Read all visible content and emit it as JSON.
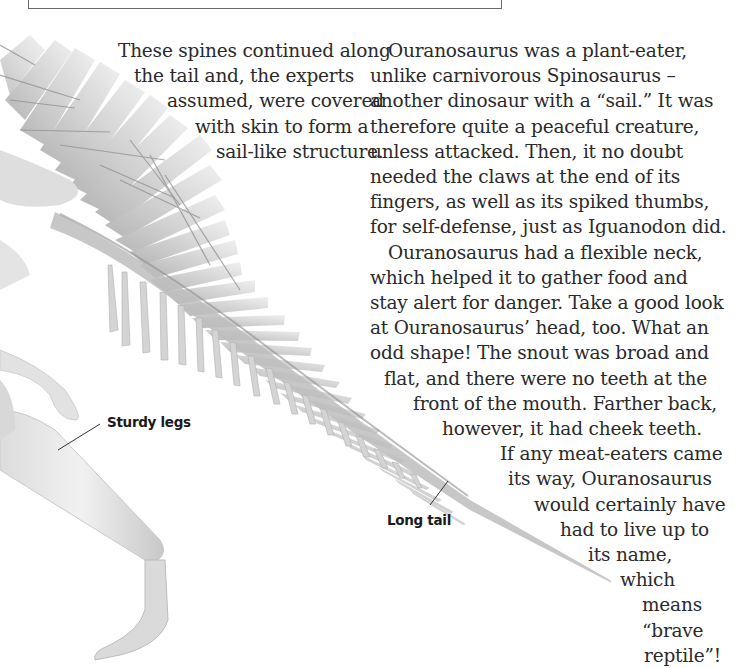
{
  "page": {
    "caption_left": {
      "lines": [
        "These spines continued along",
        "the tail and, the experts",
        "assumed, were covered",
        "with skin to form a",
        "sail-like structure."
      ]
    },
    "main_text": {
      "lines": [
        "Ouranosaurus was a plant-eater,",
        "unlike carnivorous Spinosaurus –",
        "another dinosaur with a “sail.” It was",
        "therefore quite a peaceful creature,",
        "unless attacked. Then, it no doubt",
        "needed the claws at the end of its",
        "fingers, as well as its spiked thumbs,",
        "for self-defense, just as Iguanodon did.",
        "Ouranosaurus had a flexible neck,",
        "which helped it to gather food and",
        "stay alert for danger. Take a good look",
        "at Ouranosaurus’ head, too. What an",
        "odd shape! The snout was broad and",
        "flat, and there were no teeth at the",
        "front of the mouth. Farther back,",
        "however, it had cheek teeth.",
        "If any meat-eaters came",
        "its way, Ouranosaurus",
        "would certainly have",
        "had to live up to",
        "its name,",
        "which",
        "means",
        "“brave",
        "reptile”!"
      ]
    },
    "labels": {
      "sturdy_legs": "Sturdy legs",
      "long_tail": "Long tail"
    },
    "colors": {
      "bone_light": "#e6e6e6",
      "bone_mid": "#c4c4c4",
      "bone_dark": "#9a9a9a",
      "text": "#2a2a2a"
    }
  }
}
